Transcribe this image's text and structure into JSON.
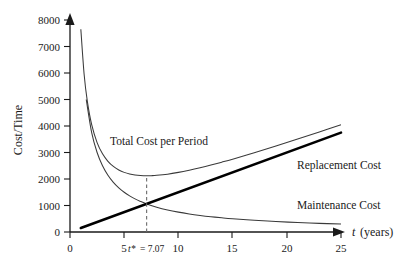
{
  "chart_data": {
    "type": "line",
    "title": "",
    "xlabel": "t (years)",
    "ylabel": "Cost/Time",
    "xlim": [
      0,
      25
    ],
    "ylim": [
      0,
      8000
    ],
    "grid": false,
    "legend_position": "inline-annotations",
    "xticks": [
      0,
      5,
      10,
      15,
      20,
      25
    ],
    "xtick_labels": [
      "0",
      "5",
      "10",
      "15",
      "20",
      "25"
    ],
    "yticks": [
      0,
      1000,
      2000,
      3000,
      4000,
      5000,
      6000,
      7000,
      8000
    ],
    "ytick_labels": [
      "0",
      "1000",
      "2000",
      "3000",
      "4000",
      "5000",
      "6000",
      "7000",
      "8000"
    ],
    "model": {
      "maintenance_cost": "K / t",
      "replacement_cost": "c * t",
      "total_cost_per_period": "K / t + c * t",
      "K": 7500,
      "c": 150,
      "t_star": 7.07,
      "total_cost_at_t_star": 2121
    },
    "series": [
      {
        "name": "Total Cost per Period",
        "style": "thin",
        "x": [
          1.0,
          1.3,
          1.6,
          2.0,
          2.5,
          3.0,
          3.5,
          4.0,
          4.5,
          5.0,
          5.5,
          6.0,
          6.5,
          7.07,
          7.5,
          8.0,
          9.0,
          10.0,
          11.0,
          12.0,
          13.0,
          14.0,
          15.0,
          17.0,
          19.0,
          21.0,
          23.0,
          25.0
        ],
        "y": [
          7650,
          5965,
          4928,
          4050,
          3375,
          2950,
          2668,
          2475,
          2342,
          2250,
          2189,
          2150,
          2129,
          2121,
          2125,
          2138,
          2183,
          2250,
          2332,
          2425,
          2527,
          2636,
          2750,
          2991,
          3245,
          3507,
          3776,
          4050
        ]
      },
      {
        "name": "Replacement Cost",
        "style": "thick",
        "x": [
          1.0,
          25.0
        ],
        "y": [
          150,
          3750
        ]
      },
      {
        "name": "Maintenance Cost",
        "style": "thin",
        "x": [
          1.5,
          2.0,
          2.5,
          3.0,
          3.5,
          4.0,
          4.5,
          5.0,
          5.5,
          6.0,
          6.5,
          7.07,
          8.0,
          9.0,
          10.0,
          11.0,
          12.0,
          13.0,
          14.0,
          15.0,
          17.0,
          19.0,
          21.0,
          23.0,
          25.0
        ],
        "y": [
          5000,
          3750,
          3000,
          2500,
          2143,
          1875,
          1667,
          1500,
          1364,
          1250,
          1154,
          1061,
          938,
          833,
          750,
          682,
          625,
          577,
          536,
          500,
          441,
          395,
          357,
          326,
          300
        ]
      }
    ],
    "annotations": [
      {
        "name": "t-star-marker",
        "text_italic": "t*",
        "text_value": "= 7.07",
        "x": 7.07,
        "type": "vertical-dashed-line",
        "from_y": 0,
        "to_y": 2121
      }
    ],
    "series_labels": {
      "total": "Total Cost per Period",
      "replacement": "Replacement Cost",
      "maintenance": "Maintenance Cost"
    }
  },
  "axes": {
    "y_title": "Cost/Time",
    "x_title_italic": "t",
    "x_title_rest": "(years)"
  },
  "colors": {
    "ink": "#1a1a1a",
    "curve_thin": "#3a3a3a",
    "curve_thick": "#000000",
    "dashed_guide": "#6a6a6a",
    "background": "#ffffff"
  }
}
